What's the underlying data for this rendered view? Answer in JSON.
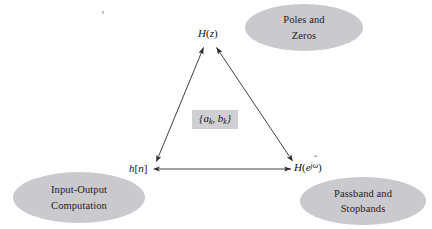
{
  "figure": {
    "title": "",
    "background_color": "#ffffff",
    "ellipse_fill": "#c9c9ce",
    "edge_color": "#2b2b2b",
    "label_box_fill": "#cfcfd4"
  },
  "nodes": {
    "top": {
      "name": "H(z)",
      "text_main": "H",
      "text_open": "(",
      "text_var": "z",
      "text_close": ")"
    },
    "bottom_left": {
      "name": "h[n]",
      "text_main": "h",
      "text_open": "[",
      "text_var": "n",
      "text_close": "]"
    },
    "bottom_right": {
      "name": "H(e^{j omega-hat})",
      "text_main": "H",
      "text_open": "(",
      "text_base": "e",
      "text_exp_j": "j",
      "text_exp_omega": "ω",
      "text_hat": "ˆ",
      "text_close": ")"
    }
  },
  "center_label": {
    "name": "{a_k, b_k}",
    "open_brace": "{",
    "a": "a",
    "a_sub": "k",
    "comma": ", ",
    "b": "b",
    "b_sub": "k",
    "close_brace": "}"
  },
  "ellipses": [
    {
      "id": "poles-zeros",
      "line1": "Poles and",
      "line2": "Zeros"
    },
    {
      "id": "input-output",
      "line1": "Input-Output",
      "line2": "Computation"
    },
    {
      "id": "passband-stopbands",
      "line1": "Passband and",
      "line2": "Stopbands"
    }
  ],
  "edges": [
    {
      "id": "hn-to-hz",
      "from": "h[n]",
      "to": "H(z)",
      "arrow": "double"
    },
    {
      "id": "hejw-to-hz",
      "from": "H(e^{j omega-hat})",
      "to": "H(z)",
      "arrow": "double"
    },
    {
      "id": "hn-to-hejw",
      "from": "h[n]",
      "to": "H(e^{j omega-hat})",
      "arrow": "double"
    }
  ]
}
